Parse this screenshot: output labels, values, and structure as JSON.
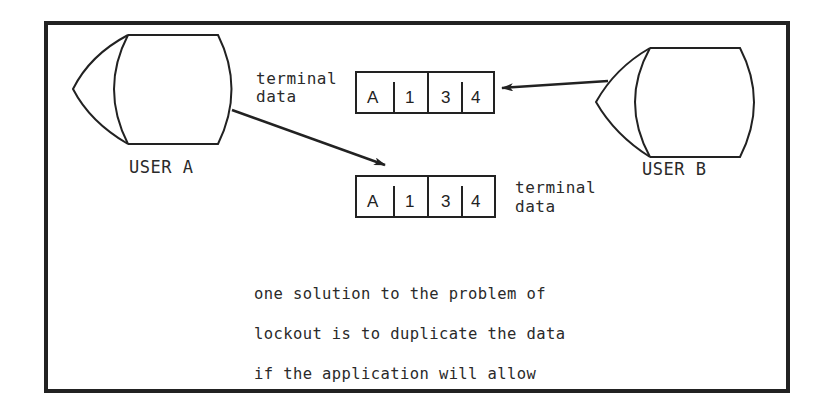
{
  "diagram": {
    "users": [
      {
        "id": "user-a",
        "label": "USER A"
      },
      {
        "id": "user-b",
        "label": "USER B"
      }
    ],
    "records": [
      {
        "id": "record-top",
        "label": "terminal\ndata",
        "label_line1": "terminal",
        "label_line2": "data",
        "cells": [
          "A",
          "1",
          "3",
          "4"
        ]
      },
      {
        "id": "record-bottom",
        "label": "terminal\ndata",
        "label_line1": "terminal",
        "label_line2": "data",
        "cells": [
          "A",
          "1",
          "3",
          "4"
        ]
      }
    ],
    "arrows": [
      {
        "from": "USER A",
        "to": "record-bottom"
      },
      {
        "from": "USER B",
        "to": "record-top"
      }
    ],
    "caption": {
      "line1": "one solution to the problem of",
      "line2": "lockout is to duplicate the data",
      "line3": "if the application will allow"
    }
  }
}
